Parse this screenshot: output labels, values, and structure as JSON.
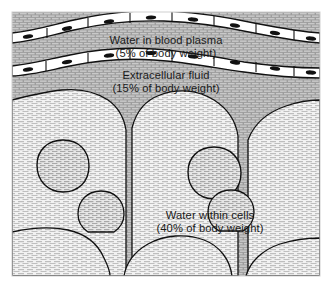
{
  "figure": {
    "regions": [
      {
        "id": "plasma",
        "line1": "Water in blood plasma",
        "line2": "(5% of body weight)",
        "percent": 5,
        "fill_shade": "dark-gray",
        "color": "#9a9a9a"
      },
      {
        "id": "extracellular",
        "line1": "Extracellular fluid",
        "line2": "(15% of body weight)",
        "percent": 15,
        "fill_shade": "dark-gray",
        "color": "#9a9a9a"
      },
      {
        "id": "intracellular",
        "line1": "Water within cells",
        "line2": "(40% of body weight)",
        "percent": 40,
        "fill_shade": "light-gray",
        "color": "#e3e3e3"
      }
    ],
    "structures": {
      "capillary_wall_label": "capillary endothelial cells",
      "nucleus_label": "cell nucleus",
      "cell_membrane_label": "cell membrane"
    },
    "colors": {
      "dark_region": "#9a9a9a",
      "light_region": "#e8e8e8",
      "nucleus": "#dcdcdc",
      "endothelial_cell": "#ffffff",
      "endothelial_nucleus": "#111111",
      "outline": "#111111",
      "page_background": "#ffffff"
    }
  }
}
